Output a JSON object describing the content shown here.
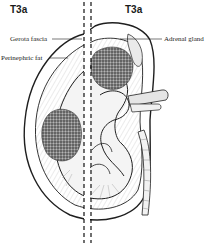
{
  "figure": {
    "left_stage_label": "T3a",
    "right_stage_label": "T3a",
    "callouts": {
      "gerota_fascia": "Gerota fascia",
      "perinephric_fat": "Perinephric fat",
      "adrenal_gland": "Adrenal gland"
    },
    "colors": {
      "ink": "#1f1f1f",
      "tumor": "#5a5a5a",
      "background": "#ffffff"
    }
  }
}
